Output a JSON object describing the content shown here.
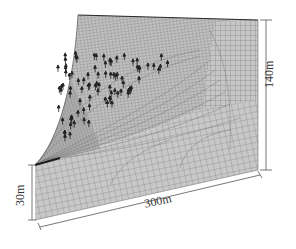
{
  "figure": {
    "colors": {
      "mesh_fill": "#c4c4c4",
      "mesh_line": "#6e6e6e",
      "dark_edge": "#2a2a2a",
      "dimension_line": "#555555",
      "marker": "#222222"
    }
  },
  "dimensions": {
    "height_right": "140m",
    "height_left": "30m",
    "length_bottom": "300m"
  },
  "geometry": {
    "top_left": [
      78,
      15
    ],
    "top_right": [
      258,
      20
    ],
    "right_bottom": [
      258,
      170
    ],
    "front_top": [
      35,
      165
    ],
    "front_bottom": [
      35,
      220
    ]
  },
  "markers": {
    "count_approx": 90,
    "shape": "arrow-up"
  }
}
